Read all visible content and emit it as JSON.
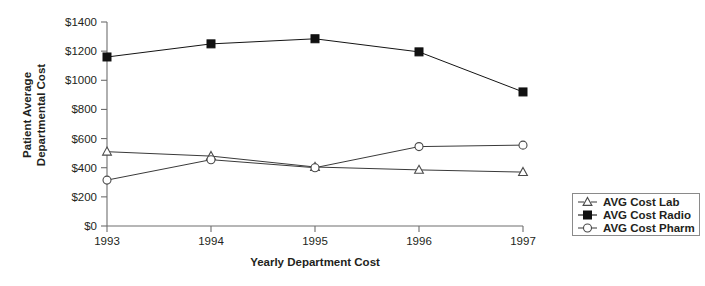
{
  "chart_data": {
    "type": "line",
    "title": "",
    "xlabel": "Yearly Department Cost",
    "ylabel": "Patient Average Departmental Cost",
    "ylabel_line1": "Patient Average",
    "ylabel_line2": "Departmental Cost",
    "categories": [
      "1993",
      "1994",
      "1995",
      "1996",
      "1997"
    ],
    "ylim": [
      0,
      1400
    ],
    "ytick_values": [
      0,
      200,
      400,
      600,
      800,
      1000,
      1200,
      1400
    ],
    "ytick_labels": [
      "$0",
      "$200",
      "$400",
      "$600",
      "$800",
      "$1000",
      "$1200",
      "$1400"
    ],
    "grid": false,
    "legend_position": "right",
    "series": [
      {
        "name": "AVG Cost Lab",
        "marker": "open-triangle",
        "color": "#4a4a4a",
        "values": [
          510,
          480,
          405,
          385,
          370
        ]
      },
      {
        "name": "AVG Cost Radio",
        "marker": "filled-square",
        "color": "#111111",
        "values": [
          1160,
          1250,
          1285,
          1195,
          920
        ]
      },
      {
        "name": "AVG Cost Pharm",
        "marker": "open-circle",
        "color": "#4a4a4a",
        "values": [
          315,
          455,
          400,
          545,
          555
        ]
      }
    ]
  },
  "legend": {
    "items": [
      {
        "label": "AVG Cost Lab"
      },
      {
        "label": "AVG Cost Radio"
      },
      {
        "label": "AVG Cost Pharm"
      }
    ]
  },
  "axes": {
    "y_title_line1": "Patient Average",
    "y_title_line2": "Departmental Cost",
    "x_title": "Yearly Department Cost"
  }
}
